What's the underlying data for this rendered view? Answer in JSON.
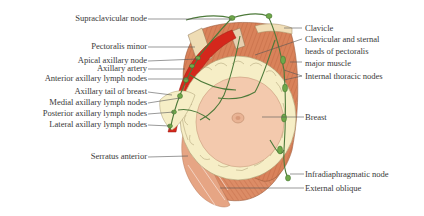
{
  "diagram": {
    "colors": {
      "muscle": "#d9825a",
      "muscle_dark": "#b8603c",
      "artery": "#d4271c",
      "fat_lobules": "#f6eec6",
      "breast": "#f3c9ad",
      "lymph": "#4d7a3a",
      "node": "#6fa84a",
      "leader_line": "#555555"
    },
    "labels_left": [
      {
        "id": "supraclavicular",
        "text": "Supraclavicular node"
      },
      {
        "id": "pectoralis-minor",
        "text": "Pectoralis minor"
      },
      {
        "id": "apical-axillary",
        "text": "Apical axillary node"
      },
      {
        "id": "axillary-artery",
        "text": "Axillary artery"
      },
      {
        "id": "anterior-axillary",
        "text": "Anterior axillary lymph nodes"
      },
      {
        "id": "axillary-tail",
        "text": "Axillary tail of breast"
      },
      {
        "id": "medial-axillary",
        "text": "Medial axillary lymph nodes"
      },
      {
        "id": "posterior-axillary",
        "text": "Posterior axillary lymph nodes"
      },
      {
        "id": "lateral-axillary",
        "text": "Lateral axillary lymph nodes"
      },
      {
        "id": "serratus-anterior",
        "text": "Serratus anterior"
      }
    ],
    "labels_right": [
      {
        "id": "clavicle",
        "text": "Clavicle"
      },
      {
        "id": "pectoralis-major-1",
        "text": "Clavicular and sternal"
      },
      {
        "id": "pectoralis-major-2",
        "text": "heads of pectoralis"
      },
      {
        "id": "pectoralis-major-3",
        "text": "major muscle"
      },
      {
        "id": "internal-thoracic",
        "text": "Internal thoracic nodes"
      },
      {
        "id": "breast",
        "text": "Breast"
      },
      {
        "id": "infradiaphragmatic",
        "text": "Infradiaphragmatic node"
      },
      {
        "id": "external-oblique",
        "text": "External oblique"
      }
    ]
  }
}
